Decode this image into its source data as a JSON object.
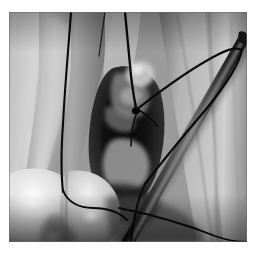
{
  "page": {
    "background_color": "#ffffff",
    "width": 256,
    "height": 259
  },
  "figure": {
    "name": "surgical-photograph",
    "modality": "clinical photograph",
    "color_mode": "grayscale",
    "frame": {
      "x": 9,
      "y": 12,
      "width": 238,
      "height": 230
    },
    "border_color": "#8a8a8a",
    "tones": {
      "highlight": "#f2f0ec",
      "midtone": "#9b9a96",
      "shadow": "#2a2a28",
      "deep_shadow": "#101010",
      "suture": "#0d0d0d",
      "instrument": "#1d1f20"
    }
  },
  "footer": {
    "thumbnail_button_label": "",
    "thumbnail_button_color": "#dcdcdc"
  }
}
